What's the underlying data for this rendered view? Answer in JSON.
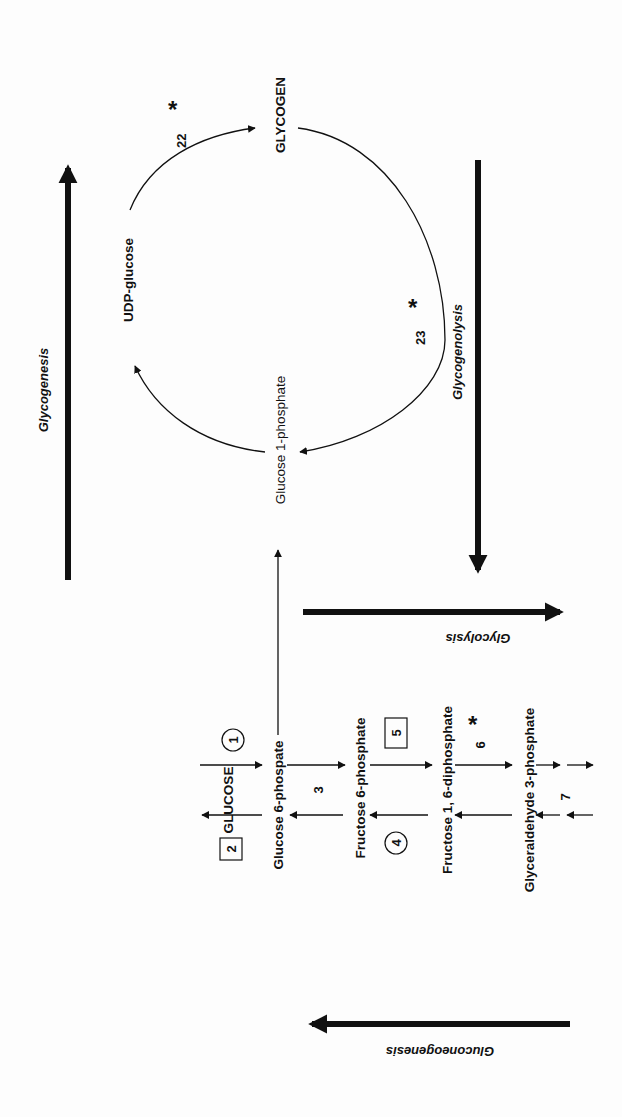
{
  "colors": {
    "ink": "#111111",
    "background": "#fdfdfd"
  },
  "processes": {
    "glycogenesis": "Glycogenesis",
    "glycogenolysis": "Glycogenolysis",
    "glycolysis": "Glycolysis",
    "gluconeogenesis": "Gluconeogenesis"
  },
  "cycle": {
    "glycogen": "GLYCOGEN",
    "udp_glucose": "UDP-glucose",
    "glucose_1_phosphate": "Glucose 1-phosphate",
    "enzyme_22": "22",
    "enzyme_23": "23",
    "regulated_mark": "*"
  },
  "pathway": {
    "metabolites": [
      "GLUCOSE",
      "Glucose 6-phospate",
      "Fructose 6-phosphate",
      "Fructose 1, 6-diphosphate",
      "Glyceraldehyde 3-phosphate"
    ],
    "enzymes": {
      "e1": "1",
      "e2": "2",
      "e3": "3",
      "e4": "4",
      "e5": "5",
      "e6": "6",
      "e7": "7"
    },
    "enzyme_shapes": {
      "1": "circle",
      "2": "square",
      "3": "plain",
      "4": "circle",
      "5": "square",
      "6": "plain-starred",
      "7": "plain"
    }
  }
}
